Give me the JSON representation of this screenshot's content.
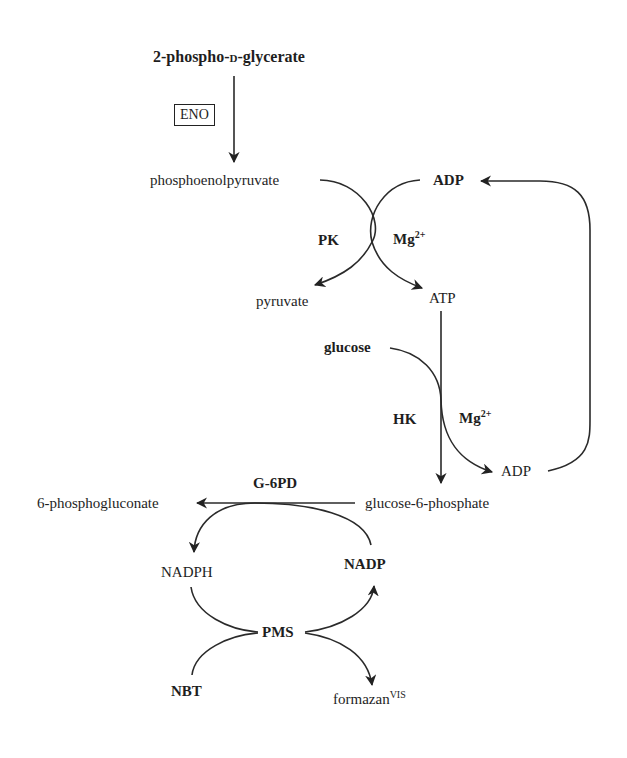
{
  "diagram": {
    "type": "biochemical coupled enzyme pathway",
    "nodes": {
      "pg2": {
        "pre": "2-phospho-",
        "sc": "d",
        "post": "-glycerate"
      },
      "eno": "ENO",
      "pep": "phosphoenolpyruvate",
      "adp_top": "ADP",
      "pk": "PK",
      "mg1": {
        "base": "Mg",
        "sup": "2+"
      },
      "pyruvate": "pyruvate",
      "atp": "ATP",
      "glucose": "glucose",
      "hk": "HK",
      "mg2": {
        "base": "Mg",
        "sup": "2+"
      },
      "adp_bottom": "ADP",
      "g6pd": "G-6PD",
      "pgluconate": "6-phosphogluconate",
      "g6p": "glucose-6-phosphate",
      "nadph": "NADPH",
      "nadp": "NADP",
      "pms": "PMS",
      "nbt": "NBT",
      "formazan": {
        "base": "formazan",
        "sup": "VIS"
      }
    },
    "edges": [
      {
        "from": "2-phospho-D-glycerate",
        "to": "phosphoenolpyruvate",
        "enzyme": "ENO"
      },
      {
        "from": "phosphoenolpyruvate",
        "to": "pyruvate",
        "enzyme": "PK"
      },
      {
        "from": "ADP",
        "to": "ATP",
        "cofactor": "Mg2+"
      },
      {
        "from": "ATP",
        "to": "glucose-6-phosphate"
      },
      {
        "from": "glucose",
        "to": "ADP",
        "enzyme": "HK",
        "cofactor": "Mg2+"
      },
      {
        "from": "ADP",
        "to": "ADP (top)",
        "type": "recycle loop"
      },
      {
        "from": "glucose-6-phosphate",
        "to": "6-phosphogluconate",
        "enzyme": "G-6PD"
      },
      {
        "from": "NADP",
        "to": "NADPH"
      },
      {
        "from": "NADPH",
        "to": "NADP",
        "via": "PMS"
      },
      {
        "from": "NBT",
        "to": "formazanVIS",
        "via": "PMS"
      }
    ]
  }
}
